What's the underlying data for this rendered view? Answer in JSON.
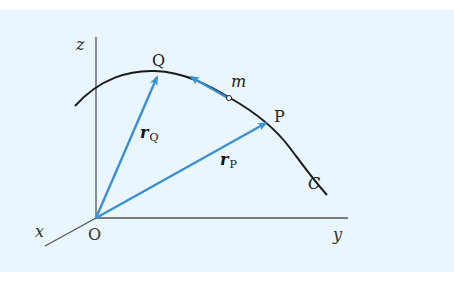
{
  "diagram": {
    "type": "position-vectors-on-curve",
    "background_color": "#eaf6fd",
    "axis_color": "#555555",
    "curve_color": "#1a1a1a",
    "vector_color": "#3a8fd6",
    "axes": {
      "z_label": "z",
      "y_label": "y",
      "x_label": "x",
      "origin_label": "O"
    },
    "curve": {
      "label": "C"
    },
    "points": {
      "Q": {
        "label": "Q"
      },
      "P": {
        "label": "P"
      },
      "m": {
        "label": "m"
      }
    },
    "vectors": {
      "r_Q": {
        "symbol": "r",
        "subscript": "Q"
      },
      "r_P": {
        "symbol": "r",
        "subscript": "P"
      },
      "velocity": {
        "description": "tangent arrow at m pointing toward Q"
      }
    }
  }
}
